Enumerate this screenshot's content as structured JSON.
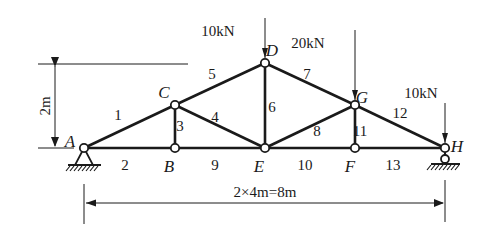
{
  "diagram": {
    "type": "truss",
    "colors": {
      "stroke": "#1a1a1a",
      "background": "#ffffff"
    },
    "nodes": [
      {
        "id": "A",
        "label": "A",
        "x": 84,
        "y": 148,
        "lx": 70,
        "ly": 147
      },
      {
        "id": "B",
        "label": "B",
        "x": 175,
        "y": 148,
        "lx": 169,
        "ly": 172
      },
      {
        "id": "C",
        "label": "C",
        "x": 175,
        "y": 105,
        "lx": 164,
        "ly": 98
      },
      {
        "id": "D",
        "label": "D",
        "x": 265,
        "y": 63,
        "lx": 272,
        "ly": 56
      },
      {
        "id": "E",
        "label": "E",
        "x": 265,
        "y": 148,
        "lx": 259,
        "ly": 172
      },
      {
        "id": "F",
        "label": "F",
        "x": 355,
        "y": 148,
        "lx": 350,
        "ly": 172
      },
      {
        "id": "G",
        "label": "G",
        "x": 355,
        "y": 105,
        "lx": 362,
        "ly": 103
      },
      {
        "id": "H",
        "label": "H",
        "x": 445,
        "y": 148,
        "lx": 457,
        "ly": 152
      }
    ],
    "members": [
      {
        "id": "1",
        "label": "1",
        "from": "A",
        "to": "C",
        "lx": 118,
        "ly": 120
      },
      {
        "id": "2",
        "label": "2",
        "from": "A",
        "to": "B",
        "lx": 125,
        "ly": 170
      },
      {
        "id": "3",
        "label": "3",
        "from": "B",
        "to": "C",
        "lx": 180,
        "ly": 131
      },
      {
        "id": "4",
        "label": "4",
        "from": "C",
        "to": "E",
        "lx": 215,
        "ly": 122
      },
      {
        "id": "5",
        "label": "5",
        "from": "C",
        "to": "D",
        "lx": 212,
        "ly": 79
      },
      {
        "id": "6",
        "label": "6",
        "from": "D",
        "to": "E",
        "lx": 272,
        "ly": 112
      },
      {
        "id": "7",
        "label": "7",
        "from": "D",
        "to": "G",
        "lx": 307,
        "ly": 79
      },
      {
        "id": "8",
        "label": "8",
        "from": "E",
        "to": "G",
        "lx": 317,
        "ly": 136
      },
      {
        "id": "9",
        "label": "9",
        "from": "B",
        "to": "E",
        "lx": 215,
        "ly": 170
      },
      {
        "id": "10",
        "label": "10",
        "from": "E",
        "to": "F",
        "lx": 305,
        "ly": 170
      },
      {
        "id": "11",
        "label": "11",
        "from": "F",
        "to": "G",
        "lx": 360,
        "ly": 136
      },
      {
        "id": "12",
        "label": "12",
        "from": "G",
        "to": "H",
        "lx": 400,
        "ly": 118
      },
      {
        "id": "13",
        "label": "13",
        "from": "F",
        "to": "H",
        "lx": 393,
        "ly": 170
      }
    ],
    "loads": [
      {
        "node": "D",
        "label": "10kN",
        "x": 265,
        "y_top": 18,
        "y_tip": 62,
        "lx": 218,
        "ly": 36
      },
      {
        "node": "G",
        "label": "20kN",
        "x": 355,
        "y_top": 30,
        "y_tip": 104,
        "lx": 308,
        "ly": 48
      },
      {
        "node": "H",
        "label": "10kN",
        "x": 445,
        "y_top": 103,
        "y_tip": 147,
        "lx": 421,
        "ly": 98
      }
    ],
    "supports": [
      {
        "node": "A",
        "type": "pin"
      },
      {
        "node": "H",
        "type": "roller"
      }
    ],
    "dimensions": {
      "height_label": "2m",
      "span_label": "2×4m=8m"
    }
  }
}
